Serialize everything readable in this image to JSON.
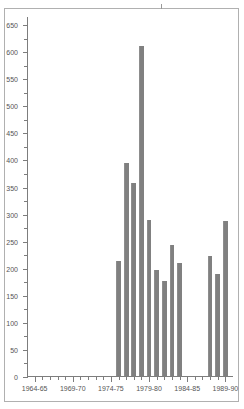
{
  "chart_data": {
    "type": "bar",
    "title": "",
    "subtitle": "",
    "xlabel": "",
    "ylabel": "",
    "ylim": [
      0,
      665
    ],
    "grid": false,
    "legend": null,
    "y_ticks_major": [
      0,
      50,
      100,
      150,
      200,
      250,
      300,
      350,
      400,
      450,
      500,
      550,
      600,
      650
    ],
    "y_tick_labels": [
      "0",
      "50",
      "100",
      "150",
      "200",
      "250",
      "300",
      "350",
      "400",
      "450",
      "500",
      "550",
      "600",
      "650"
    ],
    "x_tick_labels": [
      "1964-65",
      "1969-70",
      "1974-75",
      "1979-80",
      "1984-85",
      "1989-90"
    ],
    "x_major_indices": [
      0,
      5,
      10,
      15,
      20,
      25
    ],
    "categories": [
      "1964-65",
      "1965-66",
      "1966-67",
      "1967-68",
      "1968-69",
      "1969-70",
      "1970-71",
      "1971-72",
      "1972-73",
      "1973-74",
      "1974-75",
      "1975-76",
      "1976-77",
      "1977-78",
      "1978-79",
      "1979-80",
      "1980-81",
      "1981-82",
      "1982-83",
      "1983-84",
      "1984-85",
      "1985-86",
      "1986-87",
      "1987-88",
      "1988-89",
      "1989-90"
    ],
    "values": [
      0,
      0,
      0,
      0,
      0,
      0,
      0,
      0,
      0,
      0,
      0,
      213,
      394,
      357,
      610,
      289,
      196,
      176,
      242,
      209,
      0,
      0,
      0,
      222,
      188,
      287
    ],
    "bar_color": "#808080",
    "axis_color": "#7d7d7d",
    "frame_color": "#b0b0b0",
    "background_color": "#ffffff"
  }
}
